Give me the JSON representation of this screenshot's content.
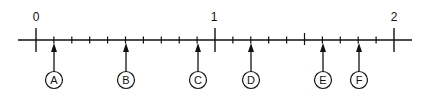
{
  "diagram": {
    "type": "number-line",
    "range": [
      0,
      2
    ],
    "subdivision": 0.1,
    "numbered_ticks": [
      {
        "value": 0,
        "label": "0"
      },
      {
        "value": 1,
        "label": "1"
      },
      {
        "value": 2,
        "label": "2"
      }
    ],
    "half_tick": {
      "value": 1.5
    },
    "markers": [
      {
        "label": "A",
        "value": 0.1
      },
      {
        "label": "B",
        "value": 0.5
      },
      {
        "label": "C",
        "value": 0.9
      },
      {
        "label": "D",
        "value": 1.2
      },
      {
        "label": "E",
        "value": 1.6
      },
      {
        "label": "F",
        "value": 1.8
      }
    ],
    "colors": {
      "line": "#111111",
      "background": "#ffffff"
    }
  }
}
